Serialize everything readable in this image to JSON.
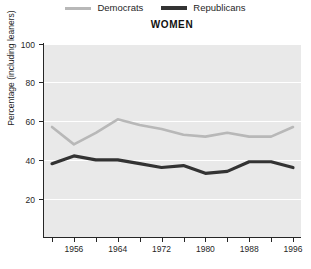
{
  "legend": {
    "items": [
      {
        "label": "Democrats",
        "color": "#b8b8b8",
        "key": "democrats"
      },
      {
        "label": "Republicans",
        "color": "#333333",
        "key": "republicans"
      }
    ]
  },
  "title": "WOMEN",
  "axes": {
    "ylabel": "Percentage (including leaners)",
    "yticks": [
      "20",
      "40",
      "60",
      "80",
      "100"
    ],
    "xticks_labeled": [
      "1956",
      "1964",
      "1972",
      "1980",
      "1988",
      "1996"
    ]
  },
  "chart_data": {
    "type": "line",
    "title": "WOMEN",
    "xlabel": "",
    "ylabel": "Percentage (including leaners)",
    "ylim": [
      0,
      100
    ],
    "xlim": [
      1952,
      1996
    ],
    "grid": true,
    "legend_position": "top-center",
    "x": [
      1952,
      1956,
      1960,
      1964,
      1968,
      1972,
      1976,
      1980,
      1984,
      1988,
      1992,
      1996
    ],
    "xtick_labels": [
      "",
      "1956",
      "",
      "1964",
      "",
      "1972",
      "",
      "1980",
      "",
      "1988",
      "",
      "1996"
    ],
    "ytick_values": [
      20,
      40,
      60,
      80,
      100
    ],
    "series": [
      {
        "name": "Democrats",
        "color": "#b8b8b8",
        "values": [
          57,
          48,
          54,
          61,
          58,
          56,
          53,
          52,
          54,
          52,
          52,
          57
        ]
      },
      {
        "name": "Republicans",
        "color": "#333333",
        "values": [
          38,
          42,
          40,
          40,
          38,
          36,
          37,
          33,
          34,
          39,
          39,
          36
        ]
      }
    ]
  }
}
